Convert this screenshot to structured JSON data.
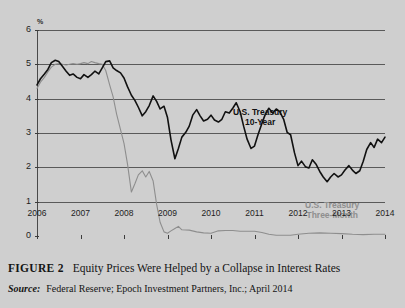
{
  "figure": {
    "number_label": "FIGURE 2",
    "caption": "Equity Prices Were Helped by a Collapse in Interest Rates",
    "source_label": "Source:",
    "source_text": "Federal Reserve; Epoch Investment Partners, Inc.; April 2014"
  },
  "annotations": {
    "ten_year_line1": "U.S. Treasury",
    "ten_year_line2": "10-Year",
    "three_month_line1": "U.S. Treasury",
    "three_month_line2": "Three-Month"
  },
  "colors": {
    "background": "#cfcfcf",
    "gridline": "#5a5a5a",
    "ten_year": "#111111",
    "three_month": "#8e8e8e",
    "text": "#1a1a1a"
  },
  "chart_data": {
    "type": "line",
    "title": "Equity Prices Were Helped by a Collapse in Interest Rates",
    "xlabel": "",
    "ylabel": "%",
    "unit": "%",
    "grid": true,
    "legend_position": "inline-annotations",
    "xlim": [
      2006,
      2014
    ],
    "ylim": [
      0,
      6
    ],
    "ytick_labels": [
      "0",
      "1",
      "2",
      "3",
      "4",
      "5",
      "6"
    ],
    "yticks": [
      0,
      1,
      2,
      3,
      4,
      5,
      6
    ],
    "xtick_labels": [
      "2006",
      "2007",
      "2008",
      "2009",
      "2010",
      "2011",
      "2012",
      "2013",
      "2014"
    ],
    "xticks": [
      2006,
      2007,
      2008,
      2009,
      2010,
      2011,
      2012,
      2013,
      2014
    ],
    "series": [
      {
        "name": "U.S. Treasury 10-Year",
        "color": "#111111",
        "x": [
          2006.0,
          2006.08,
          2006.17,
          2006.25,
          2006.33,
          2006.42,
          2006.5,
          2006.58,
          2006.67,
          2006.75,
          2006.83,
          2006.92,
          2007.0,
          2007.08,
          2007.17,
          2007.25,
          2007.33,
          2007.42,
          2007.5,
          2007.58,
          2007.67,
          2007.75,
          2007.83,
          2007.92,
          2008.0,
          2008.08,
          2008.17,
          2008.25,
          2008.33,
          2008.42,
          2008.5,
          2008.58,
          2008.67,
          2008.75,
          2008.83,
          2008.92,
          2009.0,
          2009.08,
          2009.17,
          2009.25,
          2009.33,
          2009.42,
          2009.5,
          2009.58,
          2009.67,
          2009.75,
          2009.83,
          2009.92,
          2010.0,
          2010.08,
          2010.17,
          2010.25,
          2010.33,
          2010.42,
          2010.5,
          2010.58,
          2010.67,
          2010.75,
          2010.83,
          2010.92,
          2011.0,
          2011.08,
          2011.17,
          2011.25,
          2011.33,
          2011.42,
          2011.5,
          2011.58,
          2011.67,
          2011.75,
          2011.83,
          2011.92,
          2012.0,
          2012.08,
          2012.17,
          2012.25,
          2012.33,
          2012.42,
          2012.5,
          2012.58,
          2012.67,
          2012.75,
          2012.83,
          2012.92,
          2013.0,
          2013.08,
          2013.17,
          2013.25,
          2013.33,
          2013.42,
          2013.5,
          2013.58,
          2013.67,
          2013.75,
          2013.83,
          2013.92,
          2014.0
        ],
        "values": [
          4.4,
          4.58,
          4.72,
          4.85,
          5.05,
          5.12,
          5.08,
          4.95,
          4.8,
          4.68,
          4.72,
          4.62,
          4.58,
          4.7,
          4.62,
          4.7,
          4.8,
          4.72,
          4.9,
          5.08,
          5.1,
          4.9,
          4.82,
          4.75,
          4.6,
          4.35,
          4.1,
          3.95,
          3.75,
          3.5,
          3.62,
          3.8,
          4.08,
          3.92,
          3.7,
          3.78,
          3.45,
          2.8,
          2.25,
          2.55,
          2.88,
          3.02,
          3.2,
          3.52,
          3.68,
          3.5,
          3.35,
          3.4,
          3.52,
          3.38,
          3.32,
          3.4,
          3.62,
          3.58,
          3.72,
          3.88,
          3.62,
          3.2,
          2.82,
          2.55,
          2.62,
          2.95,
          3.28,
          3.55,
          3.72,
          3.58,
          3.7,
          3.62,
          3.4,
          3.02,
          2.95,
          2.42,
          2.05,
          2.18,
          2.02,
          1.98,
          2.22,
          2.08,
          1.88,
          1.72,
          1.58,
          1.72,
          1.82,
          1.72,
          1.78,
          1.92,
          2.05,
          1.92,
          1.82,
          1.9,
          2.18,
          2.52,
          2.72,
          2.58,
          2.82,
          2.72,
          2.88
        ]
      },
      {
        "name": "U.S. Treasury Three-Month",
        "color": "#8e8e8e",
        "x": [
          2006.0,
          2006.08,
          2006.17,
          2006.25,
          2006.33,
          2006.42,
          2006.5,
          2006.58,
          2006.67,
          2006.75,
          2006.83,
          2006.92,
          2007.0,
          2007.08,
          2007.17,
          2007.25,
          2007.33,
          2007.42,
          2007.5,
          2007.58,
          2007.67,
          2007.75,
          2007.83,
          2007.92,
          2008.0,
          2008.08,
          2008.17,
          2008.25,
          2008.33,
          2008.42,
          2008.5,
          2008.58,
          2008.67,
          2008.75,
          2008.83,
          2008.92,
          2009.0,
          2009.08,
          2009.17,
          2009.25,
          2009.33,
          2009.5,
          2009.67,
          2009.83,
          2010.0,
          2010.17,
          2010.33,
          2010.5,
          2010.67,
          2010.83,
          2011.0,
          2011.17,
          2011.33,
          2011.5,
          2011.67,
          2011.83,
          2012.0,
          2012.25,
          2012.5,
          2012.75,
          2013.0,
          2013.25,
          2013.5,
          2013.75,
          2014.0
        ],
        "values": [
          4.3,
          4.48,
          4.62,
          4.78,
          4.92,
          5.0,
          5.02,
          5.0,
          4.98,
          5.0,
          5.02,
          5.0,
          5.02,
          5.05,
          5.02,
          5.08,
          5.05,
          5.02,
          5.0,
          4.82,
          4.4,
          4.05,
          3.55,
          3.1,
          2.7,
          2.1,
          1.28,
          1.52,
          1.78,
          1.9,
          1.72,
          1.88,
          1.6,
          0.92,
          0.4,
          0.12,
          0.08,
          0.15,
          0.22,
          0.28,
          0.18,
          0.17,
          0.12,
          0.09,
          0.08,
          0.15,
          0.16,
          0.16,
          0.14,
          0.14,
          0.14,
          0.1,
          0.05,
          0.02,
          0.02,
          0.02,
          0.05,
          0.08,
          0.09,
          0.08,
          0.07,
          0.05,
          0.04,
          0.05,
          0.05
        ]
      }
    ]
  }
}
